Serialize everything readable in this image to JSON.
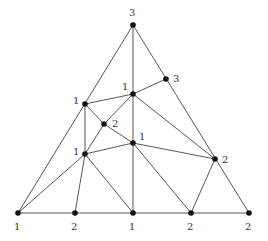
{
  "diagram": {
    "title": "",
    "nodes": [
      {
        "id": "A",
        "x": 133,
        "y": 25,
        "label": "3",
        "lx": 129,
        "ly": 16
      },
      {
        "id": "B",
        "x": 166,
        "y": 79,
        "label": "3",
        "lx": 173,
        "ly": 82
      },
      {
        "id": "C",
        "x": 133,
        "y": 94,
        "label": "1",
        "lx": 122,
        "ly": 90
      },
      {
        "id": "D",
        "x": 85,
        "y": 104,
        "label": "1",
        "lx": 73,
        "ly": 104
      },
      {
        "id": "E",
        "x": 104,
        "y": 124,
        "label": "2",
        "lx": 112,
        "ly": 127
      },
      {
        "id": "F",
        "x": 133,
        "y": 143,
        "label": "1",
        "lx": 139,
        "ly": 140
      },
      {
        "id": "G",
        "x": 85,
        "y": 154,
        "label": "1",
        "lx": 73,
        "ly": 155
      },
      {
        "id": "H",
        "x": 215,
        "y": 159,
        "label": "2",
        "lx": 222,
        "ly": 163
      },
      {
        "id": "P1",
        "x": 18,
        "y": 213,
        "label": "1",
        "lx": 14,
        "ly": 230
      },
      {
        "id": "P2",
        "x": 75,
        "y": 213,
        "label": "2",
        "lx": 71,
        "ly": 230
      },
      {
        "id": "P3",
        "x": 133,
        "y": 213,
        "label": "1",
        "lx": 129,
        "ly": 230
      },
      {
        "id": "P4",
        "x": 191,
        "y": 213,
        "label": "2",
        "lx": 187,
        "ly": 230
      },
      {
        "id": "P5",
        "x": 249,
        "y": 213,
        "label": "2",
        "lx": 245,
        "ly": 230
      }
    ],
    "edges": [
      [
        "A",
        "P1"
      ],
      [
        "A",
        "P5"
      ],
      [
        "P1",
        "P5"
      ],
      [
        "A",
        "C"
      ],
      [
        "C",
        "F"
      ],
      [
        "F",
        "P3"
      ],
      [
        "D",
        "C"
      ],
      [
        "C",
        "B"
      ],
      [
        "C",
        "E"
      ],
      [
        "C",
        "H"
      ],
      [
        "D",
        "G"
      ],
      [
        "D",
        "E"
      ],
      [
        "E",
        "F"
      ],
      [
        "E",
        "G"
      ],
      [
        "G",
        "F"
      ],
      [
        "F",
        "H"
      ],
      [
        "G",
        "P1"
      ],
      [
        "G",
        "P2"
      ],
      [
        "G",
        "P3"
      ],
      [
        "F",
        "P4"
      ],
      [
        "H",
        "P4"
      ]
    ]
  }
}
